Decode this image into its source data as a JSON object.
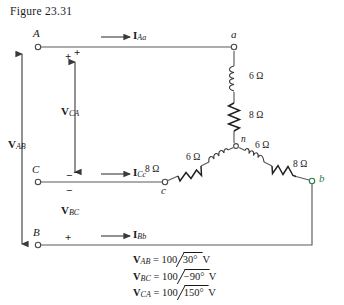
{
  "figure": {
    "title": "Figure 23.31"
  },
  "nodes": {
    "A": "A",
    "B": "B",
    "C": "C",
    "a": "a",
    "b": "b",
    "c": "c",
    "n": "n"
  },
  "polarity": {
    "A_plus": "+",
    "B_plus": "+",
    "C_minus": "−",
    "C_minus_lower": "−",
    "VCA_plus": "+",
    "VCA_minus": "−"
  },
  "currents": {
    "I_Aa": {
      "bold": "I",
      "sub": "Aa"
    },
    "I_Cc": {
      "bold": "I",
      "sub": "Cc"
    },
    "I_Bb": {
      "bold": "I",
      "sub": "Bb"
    }
  },
  "voltages": {
    "V_AB": {
      "bold": "V",
      "sub": "AB"
    },
    "V_BC": {
      "bold": "V",
      "sub": "BC"
    },
    "V_CA": {
      "bold": "V",
      "sub": "CA"
    }
  },
  "components": {
    "a_branch_inductor": "6 Ω",
    "a_branch_resistor": "8 Ω",
    "c_branch_inductor": "6 Ω",
    "c_branch_resistor": "8 Ω",
    "b_branch_inductor": "6 Ω",
    "b_branch_resistor": "8 Ω"
  },
  "equations": [
    {
      "sym": "V",
      "sub": "AB",
      "eq": "=",
      "mag": "100",
      "angle": "30°",
      "unit": "V"
    },
    {
      "sym": "V",
      "sub": "BC",
      "eq": "=",
      "mag": "100",
      "angle": "−90°",
      "unit": "V"
    },
    {
      "sym": "V",
      "sub": "CA",
      "eq": "=",
      "mag": "100",
      "angle": "150°",
      "unit": "V"
    }
  ],
  "colors": {
    "wire": "#4a4a4a",
    "ink": "#1a1a1a",
    "node_b_accent": "#2f7a4f",
    "background": "#ffffff"
  }
}
